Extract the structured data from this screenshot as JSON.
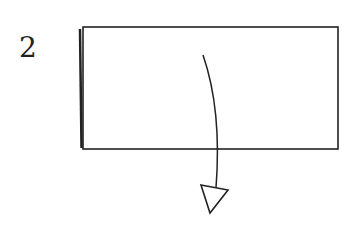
{
  "diagram": {
    "step_number": "2",
    "type": "origami-fold-step",
    "paper": {
      "x": 83,
      "y": 27,
      "width": 255,
      "height": 122,
      "stroke": "#222222",
      "fill": "#ffffff"
    },
    "fold_arrow": {
      "direction": "down",
      "style": "curved",
      "head": "hollow-triangle"
    }
  }
}
